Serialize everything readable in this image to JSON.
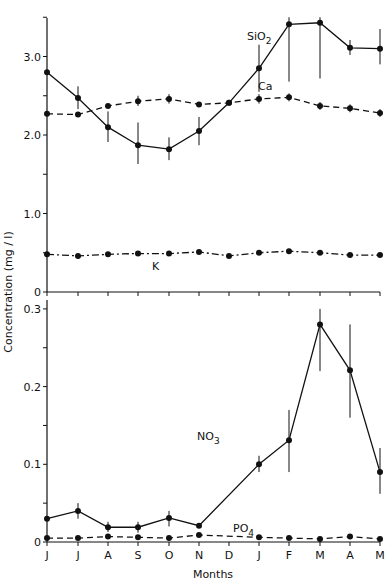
{
  "chart_data": [
    {
      "type": "line",
      "panel": "upper",
      "title": "",
      "xlabel": "",
      "ylabel": "Concentration (mg / l)",
      "ylim": [
        0,
        3.5
      ],
      "yticks": [
        0,
        1.0,
        2.0,
        3.0
      ],
      "ytick_labels": [
        "0",
        "1.0",
        "2.0",
        "3.0"
      ],
      "grid": false,
      "categories": [
        "J",
        "J",
        "A",
        "S",
        "O",
        "N",
        "D",
        "J",
        "F",
        "M",
        "A",
        "M"
      ],
      "series": [
        {
          "name": "SiO2",
          "label_text": "SiO",
          "label_sub": "2",
          "style": "solid",
          "values": [
            2.8,
            2.47,
            2.1,
            1.87,
            1.82,
            2.05,
            2.41,
            2.85,
            3.41,
            3.43,
            3.11,
            3.1
          ],
          "err_low": [
            null,
            2.33,
            1.91,
            1.63,
            1.68,
            1.87,
            null,
            2.55,
            2.68,
            2.72,
            3.02,
            2.9
          ],
          "err_high": [
            null,
            2.62,
            2.3,
            2.16,
            1.97,
            2.23,
            null,
            3.15,
            3.5,
            3.5,
            3.21,
            3.35
          ]
        },
        {
          "name": "Ca",
          "label_text": "Ca",
          "label_sub": "",
          "style": "dashed",
          "values": [
            2.27,
            2.26,
            2.37,
            2.43,
            2.46,
            2.39,
            2.41,
            2.46,
            2.48,
            2.37,
            2.34,
            2.28
          ],
          "err_low": [
            null,
            null,
            null,
            2.37,
            2.4,
            null,
            null,
            2.4,
            2.43,
            2.32,
            2.29,
            2.23
          ],
          "err_high": [
            null,
            null,
            null,
            2.5,
            2.52,
            null,
            null,
            2.52,
            2.53,
            2.42,
            2.39,
            2.33
          ]
        },
        {
          "name": "K",
          "label_text": "K",
          "label_sub": "",
          "style": "dashdot",
          "values": [
            0.48,
            0.46,
            0.48,
            0.49,
            0.49,
            0.51,
            0.46,
            0.5,
            0.52,
            0.5,
            0.47,
            0.47
          ],
          "err_low": [],
          "err_high": []
        }
      ]
    },
    {
      "type": "line",
      "panel": "lower",
      "title": "",
      "xlabel": "Months",
      "ylabel": "Concentration (mg / l)",
      "ylim": [
        0,
        0.3
      ],
      "yticks": [
        0,
        0.1,
        0.2,
        0.3
      ],
      "ytick_labels": [
        "0",
        "0.1",
        "0.2",
        "0.3"
      ],
      "grid": false,
      "categories": [
        "J",
        "J",
        "A",
        "S",
        "O",
        "N",
        "D",
        "J",
        "F",
        "M",
        "A",
        "M"
      ],
      "series": [
        {
          "name": "NO3",
          "label_text": "NO",
          "label_sub": "3",
          "style": "solid",
          "values": [
            0.03,
            0.04,
            0.019,
            0.019,
            0.031,
            0.021,
            null,
            0.1,
            0.131,
            0.28,
            0.221,
            0.09
          ],
          "err_low": [
            null,
            0.03,
            0.013,
            0.012,
            0.02,
            null,
            null,
            0.09,
            0.09,
            0.22,
            0.16,
            0.062
          ],
          "err_high": [
            null,
            0.05,
            0.026,
            0.026,
            0.04,
            null,
            null,
            0.111,
            0.17,
            0.3,
            0.28,
            0.121
          ]
        },
        {
          "name": "PO4",
          "label_text": "PO",
          "label_sub": "4",
          "style": "dashed",
          "values": [
            0.005,
            0.005,
            0.007,
            0.006,
            0.005,
            0.009,
            null,
            0.006,
            0.005,
            0.004,
            0.007,
            0.004
          ],
          "err_low": [],
          "err_high": []
        }
      ]
    }
  ],
  "axes": {
    "y_title": "Concentration (mg / l)",
    "x_title": "Months",
    "month_labels": [
      "J",
      "J",
      "A",
      "S",
      "O",
      "N",
      "D",
      "J",
      "F",
      "M",
      "A",
      "M"
    ]
  },
  "colors": {
    "ink": "#111111",
    "background": "#ffffff"
  }
}
